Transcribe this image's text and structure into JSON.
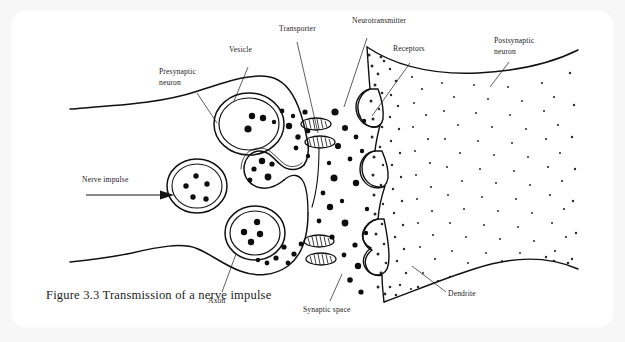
{
  "page": {
    "background_color": "#f7f7f8",
    "card_color": "#ffffff",
    "ghost_text": "",
    "width": 625,
    "height": 342
  },
  "figure": {
    "caption": "Figure 3.3 Transmission of a nerve impulse",
    "ink_color": "#101010",
    "label_color": "#1a1a1a",
    "type": "diagram"
  },
  "labels": [
    {
      "id": "presynaptic-neuron",
      "line1": "Presynaptic",
      "line2": "neuron"
    },
    {
      "id": "vesicle",
      "line1": "Vesicle",
      "line2": ""
    },
    {
      "id": "transporter",
      "line1": "Transporter",
      "line2": ""
    },
    {
      "id": "neurotransmitter",
      "line1": "Neurotransmitter",
      "line2": ""
    },
    {
      "id": "receptors",
      "line1": "Receptors",
      "line2": ""
    },
    {
      "id": "postsynaptic-neuron",
      "line1": "Postsynaptic",
      "line2": "neuron"
    },
    {
      "id": "nerve-impulse",
      "line1": "Nerve impulse",
      "line2": ""
    },
    {
      "id": "axon",
      "line1": "Axon",
      "line2": ""
    },
    {
      "id": "synaptic-space",
      "line1": "Synaptic space",
      "line2": ""
    },
    {
      "id": "dendrite",
      "line1": "Dendrite",
      "line2": ""
    }
  ],
  "parts": {
    "vesicle_count": 4,
    "transporter_count": 4,
    "receptor_count": 3,
    "arrow_direction": "right"
  }
}
